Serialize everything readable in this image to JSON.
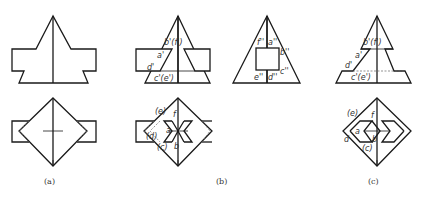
{
  "figure": {
    "captions": [
      "(a)",
      "(b)",
      "(c)"
    ],
    "panel_b": {
      "front_labels": [
        "b'(f')",
        "a'",
        "d'",
        "c'(e')"
      ],
      "side_labels": [
        "f''",
        "a''",
        "b''",
        "e''",
        "d''",
        "c''"
      ],
      "top_labels": [
        "(e)",
        "f",
        "a",
        "(d)",
        "(c)",
        "b"
      ]
    },
    "panel_c": {
      "front_labels": [
        "b'(f')",
        "a'",
        "d'",
        "c'(e')"
      ],
      "top_labels": [
        "(e)",
        "f",
        "a",
        "d",
        "b",
        "(c)"
      ]
    }
  }
}
